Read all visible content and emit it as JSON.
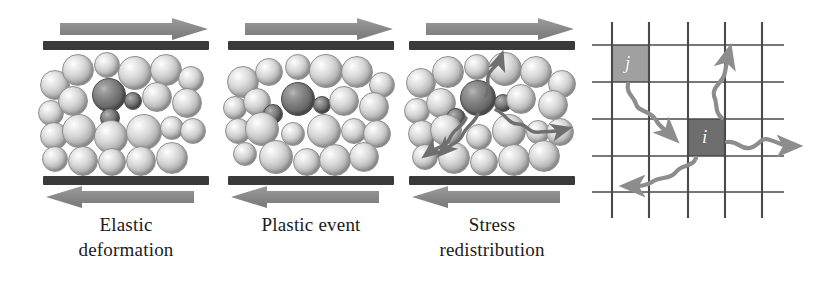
{
  "figure": {
    "background": "#ffffff",
    "width": 822,
    "height": 283
  },
  "panels": [
    {
      "id": "elastic-deformation",
      "caption_line1": "Elastic",
      "caption_line2": "deformation",
      "top_arrow_direction": "right",
      "bottom_arrow_direction": "left",
      "plate_color": "#3a3a3a",
      "arrow_color": "#8d8d8d",
      "particle_count": 24,
      "dark_particle_count": 3,
      "has_stress_squiggles": false
    },
    {
      "id": "plastic-event",
      "caption_line1": "Plastic event",
      "caption_line2": "",
      "top_arrow_direction": "right",
      "bottom_arrow_direction": "left",
      "plate_color": "#3a3a3a",
      "arrow_color": "#8d8d8d",
      "particle_count": 24,
      "dark_particle_count": 3,
      "has_stress_squiggles": false
    },
    {
      "id": "stress-redistribution",
      "caption_line1": "Stress",
      "caption_line2": "redistribution",
      "top_arrow_direction": "right",
      "bottom_arrow_direction": "left",
      "plate_color": "#3a3a3a",
      "arrow_color": "#8d8d8d",
      "particle_count": 24,
      "dark_particle_count": 3,
      "has_stress_squiggles": true
    }
  ],
  "lattice": {
    "id": "lattice-diagram",
    "grid_rows": 4,
    "grid_columns": 4,
    "grid_line_color": "#4a4a4a",
    "cells": [
      {
        "label": "j",
        "role": "source-site",
        "fill": "#a0a0a0",
        "row": 0,
        "column": 0
      },
      {
        "label": "i",
        "role": "target-site",
        "fill": "#6e6e6e",
        "row": 2,
        "column": 2
      }
    ],
    "propagation_arrows": 4,
    "arrow_color": "#8d8d8d"
  }
}
